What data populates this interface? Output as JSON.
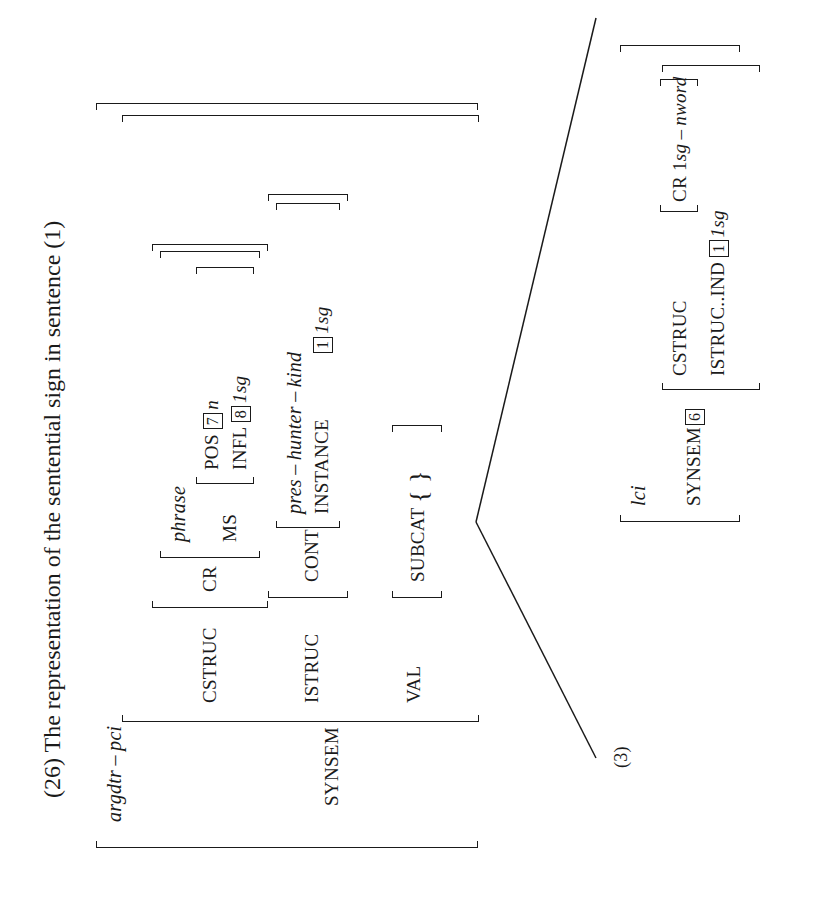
{
  "title": "(26) The representation of the sentential sign in sentence (1)",
  "avm_main": {
    "type": "argdtr – pci",
    "synsem_label": "SYNSEM",
    "cstruc": {
      "label": "CSTRUC",
      "cr_label": "CR",
      "cr_type": "phrase",
      "ms_label": "MS",
      "pos_label": "POS",
      "pos_tag": "7",
      "pos_value": "n",
      "infl_label": "INFL",
      "infl_tag": "8",
      "infl_value": "1sg"
    },
    "istruc": {
      "label": "ISTRUC",
      "cont_label": "CONT",
      "cont_type": "pres – hunter – kind",
      "instance_label": "INSTANCE",
      "instance_tag": "1",
      "instance_value": "1sg"
    },
    "val": {
      "label": "VAL",
      "subcat_label": "SUBCAT",
      "subcat_value": "{ }"
    }
  },
  "avm_daughter": {
    "type": "lci",
    "synsem_label": "SYNSEM",
    "synsem_tag": "6",
    "cstruc_label": "CSTRUC",
    "cr_text": "CR 1",
    "cr_value": "sg – nword",
    "istruc_ind_label": "ISTRUC..IND",
    "ind_tag": "1",
    "ind_value": "1sg"
  },
  "tree_label": "(3)"
}
